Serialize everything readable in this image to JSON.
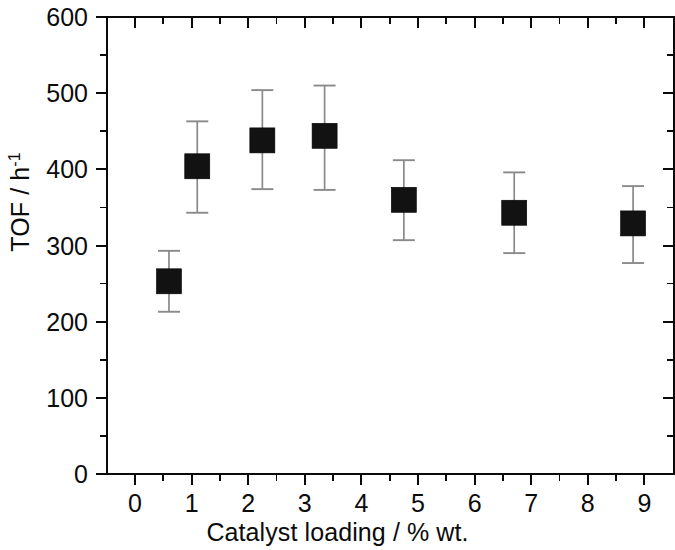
{
  "chart_data": {
    "type": "scatter",
    "title": "",
    "xlabel": "Catalyst loading / % wt.",
    "ylabel": "TOF / h⁻¹",
    "ylabel_base": "TOF / h",
    "ylabel_exponent": "-1",
    "xlim": [
      -0.65,
      9.6
    ],
    "ylim": [
      0,
      600
    ],
    "grid": false,
    "legend": null,
    "x_major_ticks": [
      0,
      1,
      2,
      3,
      4,
      5,
      6,
      7,
      8,
      9
    ],
    "x_tick_labels": [
      "0",
      "1",
      "2",
      "3",
      "4",
      "5",
      "6",
      "7",
      "8",
      "9"
    ],
    "x_minor_ticks": [
      0.5,
      1.5,
      2.5,
      3.5,
      4.5,
      5.5,
      6.5,
      7.5,
      8.5
    ],
    "y_major_ticks": [
      0,
      100,
      200,
      300,
      400,
      500,
      600
    ],
    "y_tick_labels": [
      "0",
      "100",
      "200",
      "300",
      "400",
      "500",
      "600"
    ],
    "y_minor_ticks": [
      50,
      150,
      250,
      350,
      450,
      550
    ],
    "marker_style": "filled-square",
    "marker_color": "#121212",
    "errorbar_color": "#8a8a8a",
    "series": [
      {
        "name": "TOF vs catalyst loading",
        "points": [
          {
            "x": 0.6,
            "y": 253,
            "yerr_low": 213,
            "yerr_high": 293
          },
          {
            "x": 1.1,
            "y": 404,
            "yerr_low": 343,
            "yerr_high": 463
          },
          {
            "x": 2.25,
            "y": 438,
            "yerr_low": 374,
            "yerr_high": 504
          },
          {
            "x": 3.35,
            "y": 444,
            "yerr_low": 373,
            "yerr_high": 510
          },
          {
            "x": 4.75,
            "y": 360,
            "yerr_low": 307,
            "yerr_high": 412
          },
          {
            "x": 6.7,
            "y": 343,
            "yerr_low": 290,
            "yerr_high": 396
          },
          {
            "x": 8.8,
            "y": 329,
            "yerr_low": 277,
            "yerr_high": 378
          }
        ]
      }
    ]
  }
}
